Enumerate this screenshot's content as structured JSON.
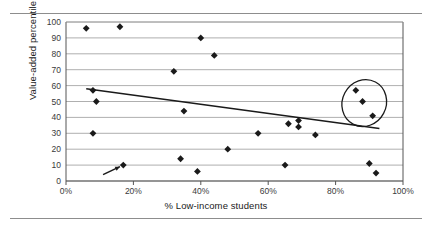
{
  "figure": {
    "ylabel": "Value-added percentile",
    "xlabel": "% Low-income students"
  },
  "axis": {
    "y_ticks": [
      "0",
      "10",
      "20",
      "30",
      "40",
      "50",
      "60",
      "70",
      "80",
      "90",
      "100"
    ],
    "x_ticks": [
      "0%",
      "20%",
      "40%",
      "60%",
      "80%",
      "100%"
    ]
  },
  "colors": {
    "marker": "#1a1a1a",
    "gridline": "#9a9a9a",
    "axis": "#555555",
    "trendline": "#1a1a1a",
    "rule": "#8d8d8d",
    "annotation": "#1a1a1a"
  },
  "chart_data": {
    "type": "scatter",
    "title": "",
    "xlabel": "% Low-income students",
    "ylabel": "Value-added percentile",
    "xlim": [
      0,
      100
    ],
    "ylim": [
      0,
      100
    ],
    "xtick_values": [
      0,
      20,
      40,
      60,
      80,
      100
    ],
    "ytick_values": [
      0,
      10,
      20,
      30,
      40,
      50,
      60,
      70,
      80,
      90,
      100
    ],
    "grid": "horizontal",
    "legend": "none",
    "points": [
      {
        "x": 6,
        "y": 96
      },
      {
        "x": 9,
        "y": 50
      },
      {
        "x": 8,
        "y": 57
      },
      {
        "x": 8,
        "y": 30
      },
      {
        "x": 17,
        "y": 10
      },
      {
        "x": 16,
        "y": 97
      },
      {
        "x": 32,
        "y": 69
      },
      {
        "x": 34,
        "y": 14
      },
      {
        "x": 35,
        "y": 44
      },
      {
        "x": 39,
        "y": 6
      },
      {
        "x": 40,
        "y": 90
      },
      {
        "x": 44,
        "y": 79
      },
      {
        "x": 48,
        "y": 20
      },
      {
        "x": 57,
        "y": 30
      },
      {
        "x": 65,
        "y": 10
      },
      {
        "x": 66,
        "y": 36
      },
      {
        "x": 69,
        "y": 38
      },
      {
        "x": 69,
        "y": 34
      },
      {
        "x": 74,
        "y": 29
      },
      {
        "x": 86,
        "y": 57
      },
      {
        "x": 88,
        "y": 50
      },
      {
        "x": 90,
        "y": 11
      },
      {
        "x": 91,
        "y": 41
      },
      {
        "x": 92,
        "y": 5
      }
    ],
    "trendline": {
      "type": "linear-fit",
      "x_start": 6,
      "y_start": 58,
      "x_end": 93,
      "y_end": 33
    },
    "annotations": [
      {
        "kind": "ellipse",
        "description": "highlighted high-performing high-poverty schools",
        "center_x": 88.5,
        "center_y": 49,
        "rx": 6.5,
        "ry": 15,
        "rotation_deg": 28
      },
      {
        "kind": "arrow",
        "description": "arrow pointing to low-value-added school",
        "from_x": 11,
        "from_y": 4,
        "to_x": 16,
        "to_y": 9
      }
    ]
  }
}
